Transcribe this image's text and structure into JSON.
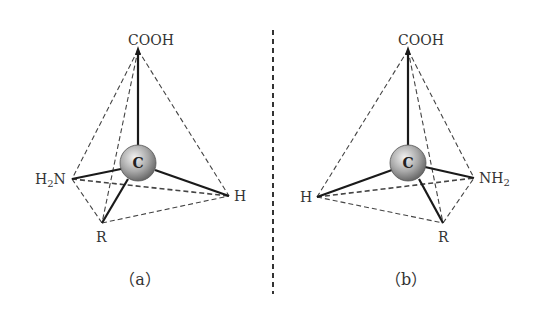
{
  "diagram": {
    "type": "stereoisomer tetrahedral comparison (amino acid enantiomers)",
    "divider": "dashed vertical mirror line",
    "panels": [
      {
        "caption": "（a）",
        "center": "C",
        "groups": {
          "top": "COOH",
          "left": "H2N",
          "right": "H",
          "bottom": "R"
        },
        "labels": {
          "top": "COOH",
          "left_main": "H",
          "left_sub": "2",
          "left_tail": "N",
          "right": "H",
          "bottom": "R"
        }
      },
      {
        "caption": "（b）",
        "center": "C",
        "groups": {
          "top": "COOH",
          "left": "H",
          "right": "NH2",
          "bottom": "R"
        },
        "labels": {
          "top": "COOH",
          "left": "H",
          "right_main": "NH",
          "right_sub": "2",
          "bottom": "R"
        }
      }
    ],
    "colors": {
      "sphere_light": "#eeeeee",
      "sphere_dark": "#707070",
      "line": "#222222",
      "dash": "#444444"
    }
  }
}
